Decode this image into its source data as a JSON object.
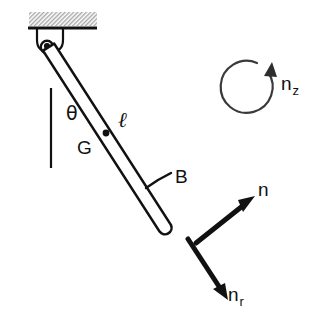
{
  "figure": {
    "background_color": "#ffffff",
    "ink_color": "#111111",
    "hatch_color": "#b4b4b4"
  },
  "labels": {
    "theta": "θ",
    "ell": "ℓ",
    "g": "G",
    "b": "B",
    "n": "n",
    "n_r_base": "n",
    "n_r_sub": "r",
    "n_z_base": "n",
    "n_z_sub": "z"
  },
  "geometry": {
    "ceiling_line_y": 28,
    "ceiling_x_start": 28,
    "ceiling_x_end": 97,
    "pivot": [
      47,
      47
    ],
    "rod_end": [
      166,
      228
    ],
    "center_of_mass_dot": [
      106,
      133
    ],
    "vertical_reference_line": [
      51,
      88,
      51,
      168
    ],
    "b_leader_from": [
      172,
      172
    ],
    "b_leader_to": [
      148,
      186
    ],
    "arrow_n_tail": [
      196,
      243
    ],
    "arrow_n_head": [
      255,
      196
    ],
    "arrow_nr_tail": [
      188,
      240
    ],
    "arrow_nr_head": [
      228,
      300
    ],
    "circular_arrow_center": [
      253,
      88
    ],
    "circular_arrow_radius": 26
  }
}
